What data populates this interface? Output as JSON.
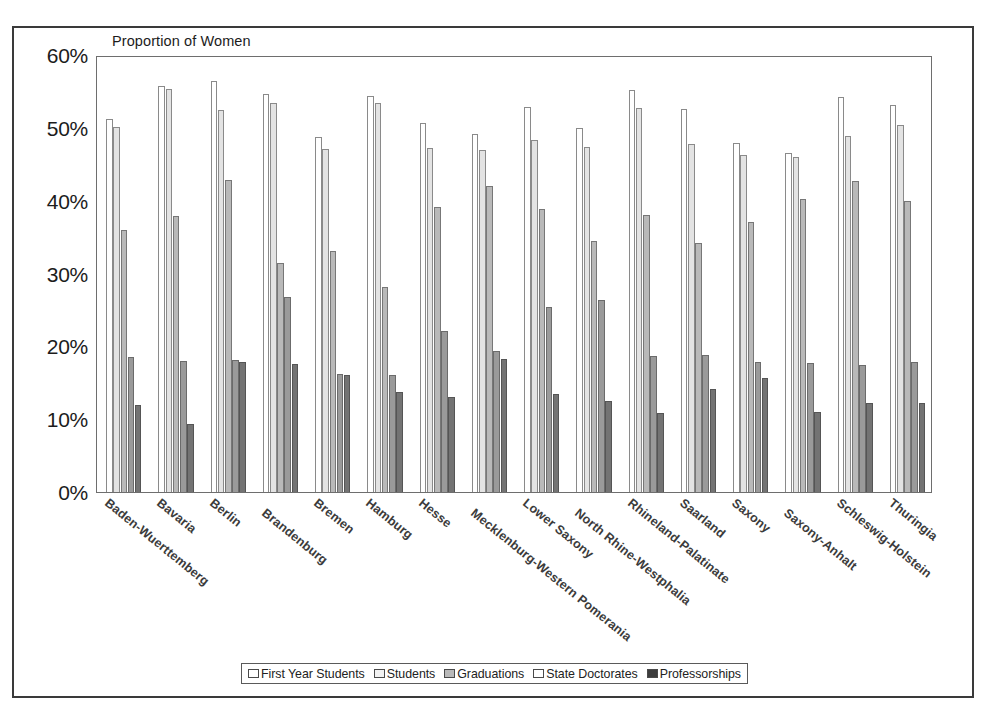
{
  "chart_data": {
    "type": "bar",
    "title": "Proportion of Women",
    "xlabel": "",
    "ylabel": "",
    "ylim": [
      0,
      60
    ],
    "ytick_labels": [
      "0%",
      "10%",
      "20%",
      "30%",
      "40%",
      "50%",
      "60%"
    ],
    "ytick_values": [
      0,
      10,
      20,
      30,
      40,
      50,
      60
    ],
    "grid": false,
    "legend_position": "bottom",
    "categories": [
      "Baden-Wuerttemberg",
      "Bavaria",
      "Berlin",
      "Brandenburg",
      "Bremen",
      "Hamburg",
      "Hesse",
      "Mecklenburg-Western Pomerania",
      "Lower Saxony",
      "North Rhine-Westphalia",
      "Rhineland-Palatinate",
      "Saarland",
      "Saxony",
      "Saxony-Anhalt",
      "Schleswig-Holstein",
      "Thuringia"
    ],
    "series": [
      {
        "name": "First Year Students",
        "values": [
          51.2,
          55.8,
          56.4,
          54.6,
          48.7,
          54.4,
          50.6,
          49.2,
          52.9,
          50.0,
          55.2,
          52.6,
          47.9,
          46.6,
          54.2,
          53.1
        ]
      },
      {
        "name": "Students",
        "values": [
          50.1,
          55.4,
          52.4,
          53.4,
          47.1,
          53.4,
          47.3,
          47.0,
          48.4,
          47.4,
          52.7,
          47.8,
          46.3,
          46.0,
          48.9,
          50.4
        ]
      },
      {
        "name": "Graduations",
        "values": [
          36.0,
          37.9,
          42.8,
          31.4,
          33.1,
          28.2,
          39.1,
          42.0,
          38.8,
          34.5,
          38.0,
          34.2,
          37.1,
          40.2,
          42.7,
          40.0
        ]
      },
      {
        "name": "State Doctorates",
        "values": [
          18.6,
          18.0,
          18.1,
          26.8,
          16.2,
          16.0,
          22.1,
          19.4,
          25.4,
          26.4,
          18.7,
          18.8,
          17.8,
          17.7,
          17.5,
          17.8
        ]
      },
      {
        "name": "Professorships",
        "values": [
          11.9,
          9.4,
          17.8,
          17.6,
          16.0,
          13.7,
          13.0,
          18.2,
          13.5,
          12.5,
          10.8,
          14.2,
          15.6,
          11.0,
          12.2,
          12.2
        ]
      }
    ]
  },
  "caption": ""
}
